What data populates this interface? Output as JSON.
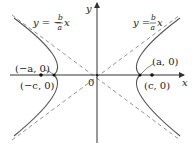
{
  "diagram": {
    "axes": {
      "x_label": "x",
      "y_label": "y",
      "origin_label": "0"
    },
    "asymptotes": {
      "left": {
        "prefix": "y = −",
        "num": "b",
        "den": "a",
        "suffix": "x"
      },
      "right": {
        "prefix": "y = ",
        "num": "b",
        "den": "a",
        "suffix": "x"
      }
    },
    "points": {
      "left_vertex": "(−a, 0)",
      "left_focus": "(−c, 0)",
      "right_vertex": "(a, 0)",
      "right_focus": "(c, 0)"
    },
    "colors": {
      "curve": "#555555",
      "axis": "#333333",
      "asymptote": "#888888",
      "text": "#222222"
    }
  }
}
